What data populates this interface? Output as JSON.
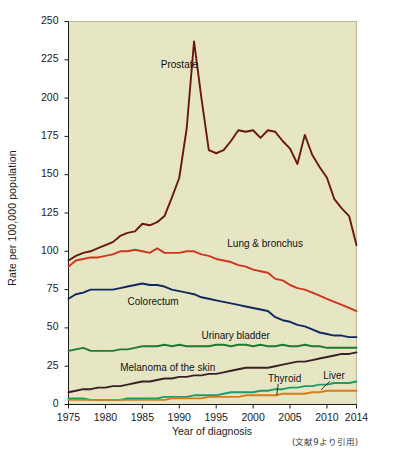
{
  "figure": {
    "citation": "(文献9より引用)"
  },
  "chart_data": {
    "type": "line",
    "title": "",
    "xlabel": "Year of diagnosis",
    "ylabel": "Rate per 100,000 population",
    "xlim": [
      1975,
      2014
    ],
    "ylim": [
      0,
      250
    ],
    "grid": false,
    "legend_position": "inline-annotations",
    "plot_background": "#e7e7c6",
    "xticks": [
      1975,
      1980,
      1985,
      1990,
      1995,
      2000,
      2005,
      2010,
      2014
    ],
    "yticks": [
      0,
      25,
      50,
      75,
      100,
      125,
      150,
      175,
      200,
      225,
      250
    ],
    "x": [
      1975,
      1976,
      1977,
      1978,
      1979,
      1980,
      1981,
      1982,
      1983,
      1984,
      1985,
      1986,
      1987,
      1988,
      1989,
      1990,
      1991,
      1992,
      1993,
      1994,
      1995,
      1996,
      1997,
      1998,
      1999,
      2000,
      2001,
      2002,
      2003,
      2004,
      2005,
      2006,
      2007,
      2008,
      2009,
      2010,
      2011,
      2012,
      2013,
      2014
    ],
    "series": [
      {
        "name": "Prostate",
        "color": "#6b1710",
        "label_x": 1987.5,
        "label_y": 221,
        "values": [
          94,
          97,
          99,
          100,
          102,
          104,
          106,
          110,
          112,
          113,
          118,
          117,
          119,
          123,
          135,
          148,
          180,
          237,
          200,
          166,
          164,
          166,
          172,
          179,
          178,
          179,
          174,
          179,
          178,
          172,
          167,
          157,
          176,
          163,
          155,
          148,
          134,
          128,
          123,
          104
        ]
      },
      {
        "name": "Lung & bronchus",
        "color": "#d2331c",
        "label_x": 1996.5,
        "label_y": 104,
        "values": [
          90,
          94,
          95,
          96,
          96,
          97,
          98,
          100,
          100,
          101,
          100,
          99,
          102,
          99,
          99,
          99,
          100,
          100,
          98,
          97,
          95,
          94,
          93,
          91,
          90,
          88,
          87,
          86,
          82,
          81,
          78,
          76,
          75,
          73,
          71,
          69,
          67,
          65,
          63,
          61
        ]
      },
      {
        "name": "Colorectum",
        "color": "#10285e",
        "label_x": 1983.0,
        "label_y": 66,
        "values": [
          69,
          72,
          73,
          75,
          75,
          75,
          75,
          76,
          77,
          78,
          79,
          78,
          78,
          77,
          75,
          74,
          73,
          72,
          70,
          69,
          68,
          67,
          66,
          65,
          64,
          63,
          62,
          61,
          57,
          55,
          54,
          52,
          51,
          49,
          47,
          46,
          45,
          45,
          44,
          44
        ]
      },
      {
        "name": "Urinary bladder",
        "color": "#1f7a2e",
        "label_x": 1993.0,
        "label_y": 44,
        "values": [
          35,
          36,
          37,
          35,
          35,
          35,
          35,
          36,
          36,
          37,
          38,
          38,
          38,
          39,
          38,
          39,
          38,
          38,
          38,
          38,
          39,
          39,
          38,
          39,
          39,
          38,
          39,
          38,
          38,
          39,
          38,
          38,
          39,
          38,
          38,
          37,
          37,
          37,
          37,
          37
        ]
      },
      {
        "name": "Melanoma of the skin",
        "color": "#3a1f28",
        "label_x": 1982.0,
        "label_y": 23,
        "values": [
          8,
          9,
          10,
          10,
          11,
          11,
          12,
          12,
          13,
          14,
          15,
          15,
          16,
          17,
          17,
          18,
          18,
          19,
          19,
          20,
          20,
          21,
          22,
          23,
          24,
          24,
          24,
          24,
          25,
          26,
          27,
          28,
          28,
          29,
          30,
          31,
          32,
          33,
          33,
          34
        ]
      },
      {
        "name": "Thyroid",
        "color": "#1f9b63",
        "label_x": 2002.0,
        "label_y": 16,
        "values": [
          4,
          4,
          4,
          3,
          3,
          3,
          3,
          3,
          4,
          4,
          4,
          4,
          4,
          5,
          5,
          5,
          5,
          6,
          6,
          6,
          6,
          7,
          8,
          8,
          8,
          8,
          9,
          9,
          10,
          10,
          11,
          11,
          12,
          12,
          13,
          13,
          14,
          14,
          14,
          15
        ]
      },
      {
        "name": "Liver",
        "color": "#e07818",
        "label_x": 2009.5,
        "label_y": 18,
        "values": [
          3,
          3,
          3,
          3,
          3,
          3,
          3,
          3,
          3,
          3,
          3,
          3,
          3,
          3,
          4,
          4,
          4,
          4,
          4,
          5,
          5,
          5,
          5,
          5,
          6,
          6,
          6,
          6,
          6,
          7,
          7,
          7,
          7,
          8,
          8,
          9,
          9,
          9,
          9,
          9
        ]
      }
    ]
  }
}
